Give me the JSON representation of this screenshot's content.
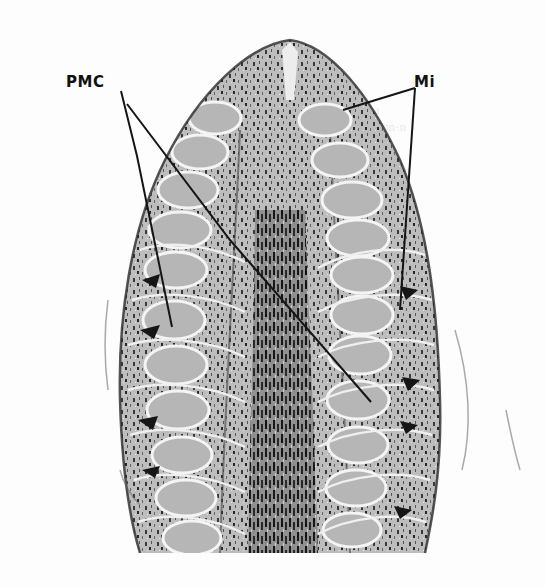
{
  "figure": {
    "labels": [
      {
        "id": "pmc",
        "text": "PMC",
        "x": 66,
        "y": 73
      },
      {
        "id": "mi",
        "text": "Mi",
        "x": 414,
        "y": 73
      }
    ],
    "leader_lines": [
      {
        "from": "pmc",
        "points": [
          [
            121,
            91
          ],
          [
            137,
            156
          ],
          [
            172,
            327
          ]
        ]
      },
      {
        "from": "pmc",
        "points": [
          [
            127,
            104
          ],
          [
            230,
            240
          ],
          [
            371,
            402
          ]
        ]
      },
      {
        "from": "mi",
        "points": [
          [
            415,
            88
          ],
          [
            343,
            110
          ]
        ]
      },
      {
        "from": "mi",
        "points": [
          [
            415,
            88
          ],
          [
            400,
            310
          ]
        ]
      }
    ],
    "colors": {
      "background": "#fdfdfd",
      "tissue_light": "#c9c9c9",
      "tissue_mid": "#8a8a8a",
      "tissue_dark": "#1e1e1e",
      "cell_fill": "#b8b8b8",
      "wall_highlight": "#f2f2f2",
      "label": "#111111"
    }
  }
}
